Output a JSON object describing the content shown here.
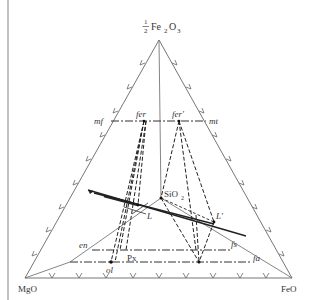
{
  "figure": {
    "type": "ternary-phase-diagram",
    "vertices": {
      "top": {
        "prefix_num": "1",
        "prefix_den": "2",
        "label": "Fe",
        "sub1": "2",
        "label2": "O",
        "sub2": "3"
      },
      "left": "MgO",
      "right": "FeO"
    },
    "phase_labels": {
      "mf": "mf",
      "mt": "mt",
      "fer": "fer",
      "fer_prime": "fer'",
      "sio2_main": "SiO",
      "sio2_sub": "2",
      "L": "L",
      "L_prime": "L'",
      "en": "en",
      "fs": "fs",
      "fa": "fa",
      "ol": "ol",
      "Px": "Px"
    },
    "colors": {
      "line": "#555555",
      "text": "#333333",
      "border": "#888888"
    }
  }
}
